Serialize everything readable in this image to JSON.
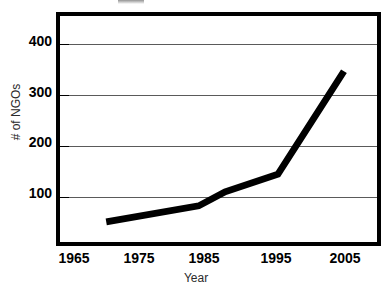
{
  "chart_data": {
    "type": "line",
    "title": "",
    "xlabel": "Year",
    "ylabel": "# of NGOs",
    "xlim": [
      1962,
      2010
    ],
    "ylim": [
      0,
      450
    ],
    "xticks": [
      1965,
      1975,
      1985,
      1995,
      2005
    ],
    "xtick_labels": [
      "1965",
      "1975",
      "1985",
      "1995",
      "2005"
    ],
    "yticks": [
      100,
      200,
      300,
      400
    ],
    "ytick_labels": [
      "100",
      "200",
      "300",
      "400"
    ],
    "grid": "horizontal",
    "legend": "none",
    "series": [
      {
        "name": "# of NGOs",
        "color": "#000000",
        "x": [
          1969,
          1983,
          1987,
          1995,
          2005
        ],
        "values": [
          40,
          72,
          100,
          135,
          340
        ]
      }
    ]
  },
  "axes": {
    "y_title": "# of NGOs",
    "x_title": "Year",
    "y_tick_labels": [
      "400",
      "300",
      "200",
      "100"
    ],
    "x_tick_labels": [
      "1965",
      "1975",
      "1985",
      "1995",
      "2005"
    ]
  },
  "style": {
    "frame_color": "#000000",
    "gridline_color": "#5a5a5a",
    "series_color": "#000000",
    "background": "#ffffff"
  }
}
